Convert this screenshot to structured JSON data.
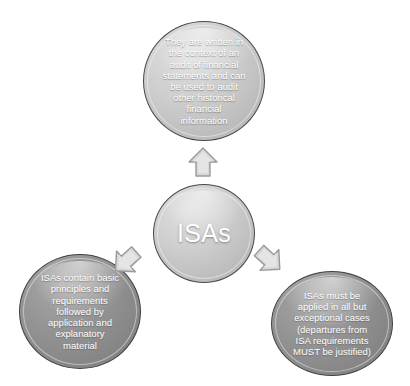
{
  "diagram": {
    "type": "hub-and-spoke",
    "center": {
      "id": "isas",
      "label": "ISAs",
      "fill": "#cdcdcd",
      "stroke": "#4a4a4a",
      "text_color": "#ffffff"
    },
    "nodes": [
      {
        "id": "top",
        "position": "top",
        "label": "They are written in\nthe context of an\naudit of financial\nstatements and can\nbe used to audit\nother historical\nfinancial\ninformation",
        "fill": "#cdcdcd",
        "stroke": "#4a4a4a",
        "text_color": "#ffffff"
      },
      {
        "id": "bottom-left",
        "position": "bottom-left",
        "label": "ISAs contain basic\nprinciples and\nrequirements\nfollowed by\napplication and\nexplanatory\nmaterial",
        "fill": "#949494",
        "stroke": "#3f3f3f",
        "text_color": "#ffffff"
      },
      {
        "id": "bottom-right",
        "position": "bottom-right",
        "label": "ISAs must be\napplied in all but\nexceptional cases\n(departures from\nISA requirements\nMUST be justified)",
        "fill": "#949494",
        "stroke": "#3f3f3f",
        "text_color": "#ffffff"
      }
    ],
    "arrows": [
      {
        "id": "arrow-up",
        "direction": "up",
        "from": "isas",
        "to": "top",
        "fill": "#d8d8d8",
        "stroke": "#9a9a9a"
      },
      {
        "id": "arrow-left",
        "direction": "down-left",
        "from": "isas",
        "to": "bottom-left",
        "fill": "#d8d8d8",
        "stroke": "#9a9a9a"
      },
      {
        "id": "arrow-right",
        "direction": "down-right",
        "from": "isas",
        "to": "bottom-right",
        "fill": "#d8d8d8",
        "stroke": "#9a9a9a"
      }
    ],
    "background": "#ffffff"
  }
}
